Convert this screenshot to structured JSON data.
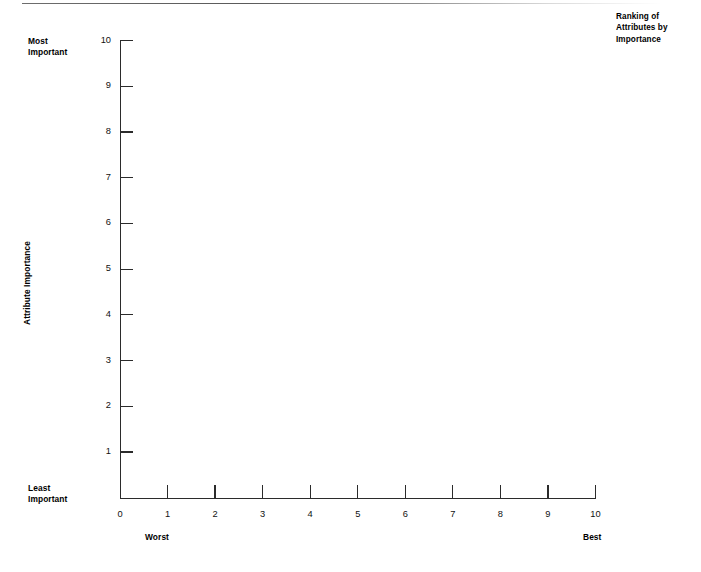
{
  "chart_data": {
    "type": "scatter",
    "title": "Ranking of Attributes by Importance",
    "title_lines": [
      "Ranking of",
      "Attributes by",
      "Importance"
    ],
    "xlabel": "",
    "ylabel": "Attribute Importance",
    "xlim": [
      0,
      10
    ],
    "ylim": [
      0,
      10
    ],
    "x_ticks": [
      0,
      1,
      2,
      3,
      4,
      5,
      6,
      7,
      8,
      9,
      10
    ],
    "y_ticks": [
      1,
      2,
      3,
      4,
      5,
      6,
      7,
      8,
      9,
      10
    ],
    "x_tick_labels": [
      "0",
      "1",
      "2",
      "3",
      "4",
      "5",
      "6",
      "7",
      "8",
      "9",
      "10"
    ],
    "y_tick_labels": [
      "1",
      "2",
      "3",
      "4",
      "5",
      "6",
      "7",
      "8",
      "9",
      "10"
    ],
    "grid": false,
    "legend": false,
    "series": [],
    "values": [],
    "annotations": [
      {
        "text": "Most Important",
        "position": "top-left-of-y-axis"
      },
      {
        "text": "Least Important",
        "position": "bottom-left-of-y-axis"
      },
      {
        "text": "Worst",
        "position": "below-x-axis-left"
      },
      {
        "text": "Best",
        "position": "below-x-axis-right"
      }
    ],
    "note": "Empty blank grid template; no data points plotted."
  },
  "title": {
    "line1": "Ranking of",
    "line2": "Attributes by",
    "line3": "Importance"
  },
  "axes": {
    "y_title": "Attribute Importance",
    "y_top_label_line1": "Most",
    "y_top_label_line2": "Important",
    "y_bottom_label_line1": "Least",
    "y_bottom_label_line2": "Important",
    "x_left_label": "Worst",
    "x_right_label": "Best",
    "y_tick_labels": [
      "10",
      "9",
      "8",
      "7",
      "6",
      "5",
      "4",
      "3",
      "2",
      "1"
    ],
    "x_tick_labels": [
      "0",
      "1",
      "2",
      "3",
      "4",
      "5",
      "6",
      "7",
      "8",
      "9",
      "10"
    ]
  },
  "colors": {
    "axis": "#2b2b2b",
    "text": "#000000",
    "background": "#ffffff",
    "top_rule": "#5a5a5a"
  }
}
